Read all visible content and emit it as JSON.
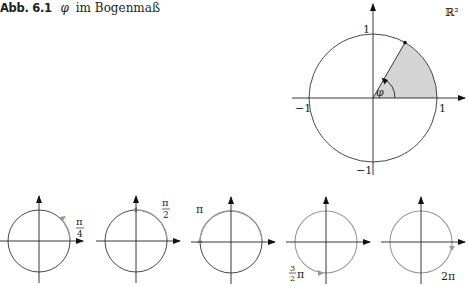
{
  "caption": {
    "label": "Abb. 6.1",
    "symbol": "φ",
    "text": "im Bogenmaß"
  },
  "main_diagram": {
    "space_label": "ℝ²",
    "angle_label": "φ",
    "tick_labels": {
      "x_pos": "1",
      "x_neg": "−1",
      "y_pos": "1",
      "y_neg": "−1"
    },
    "sector_color": "#d4d4d4",
    "arrow_color": "#111111"
  },
  "small_diagrams": [
    {
      "label": "π/4",
      "num": "π",
      "den": "4"
    },
    {
      "label": "π/2",
      "num": "π",
      "den": "2"
    },
    {
      "label": "π"
    },
    {
      "label": "3/2 π",
      "num": "3",
      "den": "2",
      "suffix": "π"
    },
    {
      "label": "2π"
    }
  ],
  "colors": {
    "axis": "#222222",
    "circle": "#333333",
    "traversed_arc": "#9a9a9a"
  }
}
